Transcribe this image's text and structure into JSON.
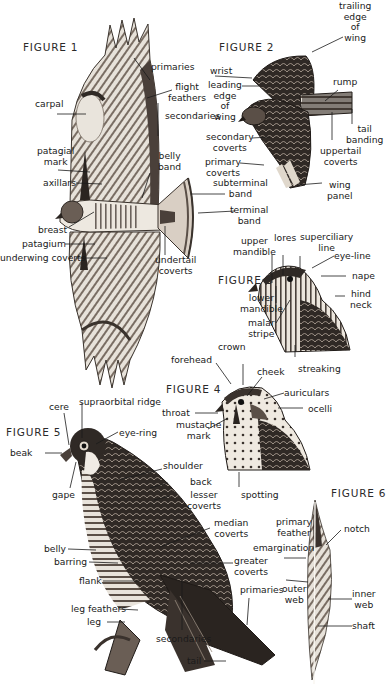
{
  "figures": {
    "fig1": {
      "title": "FIGURE 1",
      "labels": {
        "primaries": "primaries",
        "flight_feathers": "flight\nfeathers",
        "secondaries": "secondaries",
        "carpal": "carpal",
        "patagial_mark": "patagial\nmark",
        "belly_band": "belly\nband",
        "axillars": "axillars",
        "subterminal_band": "subterminal\nband",
        "terminal_band": "terminal\nband",
        "breast": "breast",
        "patagium": "patagium",
        "underwing_coverts": "underwing coverts",
        "undertail_coverts": "undertail\ncoverts"
      }
    },
    "fig2": {
      "title": "FIGURE 2",
      "labels": {
        "trailing_edge": "trailing\nedge\nof\nwing",
        "wrist": "wrist",
        "leading_edge": "leading\nedge\nof\nwing",
        "rump": "rump",
        "tail_banding": "tail\nbanding",
        "secondary_coverts": "secondary\ncoverts",
        "uppertail_coverts": "uppertail\ncoverts",
        "primary_coverts": "primary\ncoverts",
        "wing_panel": "wing\npanel"
      }
    },
    "fig3": {
      "title": "FIGURE 3",
      "labels": {
        "upper_mandible": "upper\nmandible",
        "lores": "lores",
        "superciliary_line": "superciliary\nline",
        "eye_line": "eye-line",
        "nape": "nape",
        "hind_neck": "hind\nneck",
        "lower_mandible": "lower\nmandible",
        "malar_stripe": "malar\nstripe",
        "streaking": "streaking"
      }
    },
    "fig4": {
      "title": "FIGURE 4",
      "labels": {
        "crown": "crown",
        "forehead": "forehead",
        "cheek": "cheek",
        "auriculars": "auriculars",
        "throat": "throat",
        "ocelli": "ocelli",
        "mustache_mark": "mustache\nmark",
        "spotting": "spotting"
      }
    },
    "fig5": {
      "title": "FIGURE 5",
      "labels": {
        "cere": "cere",
        "supraorbital_ridge": "supraorbital ridge",
        "eye_ring": "eye-ring",
        "beak": "beak",
        "gape": "gape",
        "shoulder": "shoulder",
        "back": "back",
        "lesser_coverts": "lesser\ncoverts",
        "median_coverts": "median\ncoverts",
        "belly": "belly",
        "barring": "barring",
        "greater_coverts": "greater\ncoverts",
        "flank": "flank",
        "primaries": "primaries",
        "leg_feathers": "leg feathers",
        "leg": "leg",
        "secondaries": "secondaries",
        "tail": "tail"
      }
    },
    "fig6": {
      "title": "FIGURE 6",
      "labels": {
        "primary_feather": "primary\nfeather",
        "notch": "notch",
        "emargination": "emargination",
        "outer_web": "outer\nweb",
        "inner_web": "inner\nweb",
        "shaft": "shaft"
      }
    }
  },
  "colors": {
    "ink": "#1a1a1a",
    "feather_dark": "#2b2622",
    "feather_mid": "#6e6258",
    "feather_light": "#d9d2c8",
    "background": "#ffffff"
  }
}
